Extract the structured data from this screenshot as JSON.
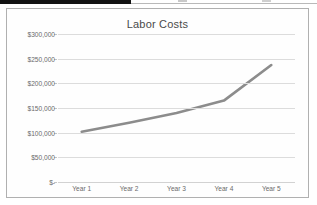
{
  "chart_data": {
    "type": "line",
    "title": "Labor Costs",
    "xlabel": "",
    "ylabel": "",
    "categories": [
      "Year 1",
      "Year 2",
      "Year 3",
      "Year 4",
      "Year 5"
    ],
    "series": [
      {
        "name": "Labor Costs",
        "values": [
          102000,
          120000,
          140000,
          165000,
          237000
        ],
        "color": "#8c8c8c"
      }
    ],
    "ylim": [
      0,
      300000
    ],
    "y_ticks": [
      0,
      50000,
      100000,
      150000,
      200000,
      250000,
      300000
    ],
    "y_tick_labels": [
      "$-",
      "$50,000",
      "$100,000",
      "$150,000",
      "$200,000",
      "$250,000",
      "$300,000"
    ],
    "grid": true,
    "legend": false,
    "legend_position": "none",
    "plot_background": "#fefefe",
    "gridline_color": "#dcdcdc",
    "axis_text_color": "#6a6a6a",
    "border_color": "#b0b0b0"
  },
  "page": {
    "background": "#ffffff",
    "scan_band_color": "#121212"
  }
}
